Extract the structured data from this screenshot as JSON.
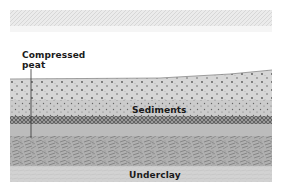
{
  "diagram": {
    "type": "geological-cross-section",
    "labels": {
      "compressed_peat_line1": "Compressed",
      "compressed_peat_line2": "peat",
      "sediments": "Sediments",
      "underclay": "Underclay"
    },
    "layers": [
      {
        "name": "faint-top-band",
        "pattern": "hatched-gray"
      },
      {
        "name": "sediments-upper",
        "pattern": "dotted"
      },
      {
        "name": "sediments-lower",
        "pattern": "dotted-fine"
      },
      {
        "name": "compressed-peat-band",
        "pattern": "cross-hatch-dark"
      },
      {
        "name": "peat-mass",
        "pattern": "crosshatch-blocks"
      },
      {
        "name": "underclay",
        "pattern": "light-gray"
      }
    ],
    "colors": {
      "background": "#ffffff",
      "top_band": "#d9d9d9",
      "sediments": "#d4d4d4",
      "peat_band": "#8a8a8a",
      "peat_mass": "#a9a9a9",
      "underclay": "#cfcfcf",
      "text": "#1a1a1a"
    }
  }
}
